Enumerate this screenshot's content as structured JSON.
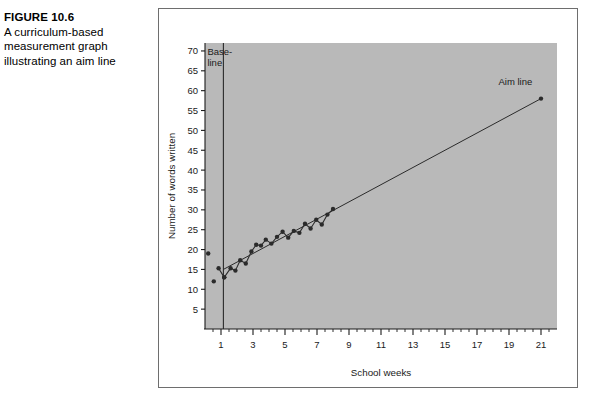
{
  "figure": {
    "number": "FIGURE 10.6",
    "caption_lines": [
      "A curriculum-based",
      "measurement graph",
      "illustrating an aim line"
    ]
  },
  "colors": {
    "plot_background": "#b9b9b9",
    "frame_border": "#6e6e6e",
    "axis": "#1a1a1a",
    "data_marker": "#2b2b2b",
    "data_line": "#2b2b2b",
    "aim_line": "#2b2b2b",
    "phase_line": "#2b2b2b",
    "page_background": "#ffffff",
    "text": "#000000"
  },
  "chart_data": {
    "type": "line",
    "title": "",
    "subtitle": "",
    "xlabel": "School weeks",
    "ylabel": "Number of words written",
    "xlim": [
      0,
      22
    ],
    "ylim": [
      0,
      72
    ],
    "grid": false,
    "legend": "none",
    "xticks": [
      1,
      3,
      5,
      7,
      9,
      11,
      13,
      15,
      17,
      19,
      21
    ],
    "xtick_labels": [
      "1",
      "3",
      "5",
      "7",
      "9",
      "11",
      "13",
      "15",
      "17",
      "19",
      "21"
    ],
    "xminorticks": [
      0.5,
      1.5,
      2,
      2.5,
      3.5,
      4,
      4.5,
      5.5,
      6,
      6.5,
      7.5,
      8,
      8.5,
      9.5,
      10,
      10.5,
      11.5,
      12,
      12.5,
      13.5,
      14,
      14.5,
      15.5,
      16,
      16.5,
      17.5,
      18,
      18.5,
      19.5,
      20,
      20.5,
      21.5
    ],
    "yticks": [
      5,
      10,
      15,
      20,
      25,
      30,
      35,
      40,
      45,
      50,
      55,
      60,
      65,
      70
    ],
    "ytick_labels": [
      "5",
      "10",
      "15",
      "20",
      "25",
      "30",
      "35",
      "40",
      "45",
      "50",
      "55",
      "60",
      "65",
      "70"
    ],
    "annotations": [
      {
        "name": "baseline-label",
        "text": "Base-line",
        "text_lines": [
          "Base-",
          "line"
        ],
        "x": 0.15,
        "y": 69
      },
      {
        "name": "aim-line-label",
        "text": "Aim line",
        "x": 19.4,
        "y": 61.5
      }
    ],
    "phase_line": {
      "name": "baseline-phase-line",
      "x": 1.15,
      "y_from": 0,
      "y_to": 72
    },
    "series": [
      {
        "name": "Baseline scores",
        "type": "scatter",
        "connected": false,
        "x": [
          0.2,
          0.55
        ],
        "values": [
          19,
          12
        ]
      },
      {
        "name": "Baseline connected scores",
        "type": "line",
        "connected": true,
        "x": [
          0.85,
          1.2
        ],
        "values": [
          15.3,
          13
        ]
      },
      {
        "name": "Student progress (words written)",
        "type": "line",
        "connected": true,
        "x": [
          1.2,
          1.6,
          1.9,
          2.2,
          2.55,
          2.9,
          3.2,
          3.5,
          3.8,
          4.15,
          4.5,
          4.85,
          5.2,
          5.55,
          5.9,
          6.25,
          6.6,
          6.95,
          7.3,
          7.65,
          8.0
        ],
        "values": [
          13,
          15.3,
          14.7,
          17.3,
          16.5,
          19.5,
          21.2,
          21.0,
          22.5,
          21.5,
          23.2,
          24.5,
          23.0,
          24.7,
          24.2,
          26.5,
          25.3,
          27.5,
          26.3,
          28.8,
          30.2
        ]
      },
      {
        "name": "Aim line",
        "type": "line",
        "connected": true,
        "x": [
          1.15,
          21.0
        ],
        "values": [
          15.0,
          58.0
        ]
      },
      {
        "name": "Aim line goal point",
        "type": "scatter",
        "connected": false,
        "x": [
          21.0
        ],
        "values": [
          58.0
        ]
      }
    ]
  }
}
